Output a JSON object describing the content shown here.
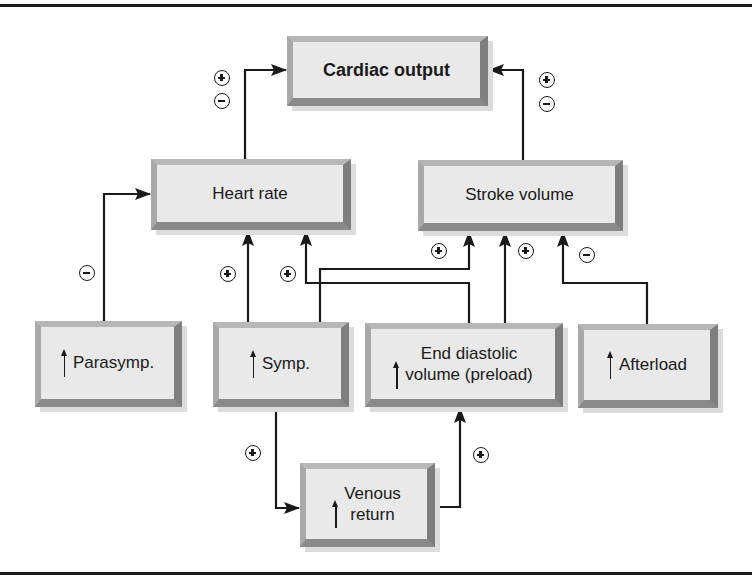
{
  "diagram": {
    "nodes": {
      "cardiac_output": {
        "label": "Cardiac output"
      },
      "heart_rate": {
        "label": "Heart rate"
      },
      "stroke_volume": {
        "label": "Stroke volume"
      },
      "parasymp": {
        "label": "Parasymp.",
        "increase_marker": "↑"
      },
      "symp": {
        "label": "Symp.",
        "increase_marker": "↑"
      },
      "edv": {
        "label_line1": "End diastolic",
        "label_line2": "volume (preload)",
        "increase_marker": "↑"
      },
      "afterload": {
        "label": "Afterload",
        "increase_marker": "↑"
      },
      "venous_return": {
        "label_line1": "Venous",
        "label_line2": "return",
        "increase_marker": "↑"
      }
    },
    "edges": [
      {
        "from": "Heart rate",
        "to": "Cardiac output",
        "effect": "+/-"
      },
      {
        "from": "Stroke volume",
        "to": "Cardiac output",
        "effect": "+/-"
      },
      {
        "from": "Parasymp.",
        "to": "Heart rate",
        "effect": "-"
      },
      {
        "from": "Symp.",
        "to": "Heart rate",
        "effect": "+"
      },
      {
        "from": "End diastolic volume (preload)",
        "to": "Heart rate",
        "effect": "+"
      },
      {
        "from": "Symp.",
        "to": "Stroke volume",
        "effect": "+"
      },
      {
        "from": "End diastolic volume (preload)",
        "to": "Stroke volume",
        "effect": "+"
      },
      {
        "from": "Afterload",
        "to": "Stroke volume",
        "effect": "-"
      },
      {
        "from": "Symp.",
        "to": "Venous return",
        "effect": "+"
      },
      {
        "from": "Venous return",
        "to": "End diastolic volume (preload)",
        "effect": "+"
      }
    ],
    "colors": {
      "line": "#1a1a1a",
      "box_fill": "#e9e9e9",
      "box_bevel_dark": "#7e7e7e",
      "box_bevel_light": "#b7b7b7"
    }
  }
}
